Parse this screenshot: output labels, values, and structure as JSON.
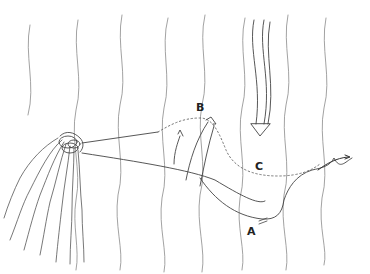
{
  "diagram": {
    "labels": {
      "a": "A",
      "b": "B",
      "c": "C"
    },
    "colors": {
      "stroke": "#6a6a6a",
      "dark_stroke": "#333333",
      "background": "#ffffff"
    },
    "elements": [
      "kelp-holdfast-cluster",
      "vertical-current-lines",
      "solid-path-to-A",
      "dotted-path-through-B-and-C",
      "upward-arrow-at-B",
      "downward-arrow-above-C",
      "trailing-arrow-right"
    ]
  }
}
